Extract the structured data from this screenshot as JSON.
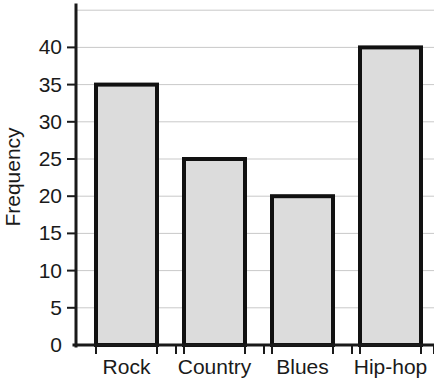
{
  "chart_data": {
    "type": "bar",
    "title": "",
    "xlabel": "",
    "ylabel": "Frequency",
    "categories": [
      "Rock",
      "Country",
      "Blues",
      "Hip-hop"
    ],
    "values": [
      35,
      25,
      20,
      40
    ],
    "ylim": [
      0,
      45
    ],
    "ytick_labels": [
      "0",
      "5",
      "10",
      "15",
      "20",
      "25",
      "30",
      "35",
      "40"
    ],
    "ytick_values": [
      0,
      5,
      10,
      15,
      20,
      25,
      30,
      35,
      40
    ],
    "ytick_step": 5,
    "grid": true,
    "grid_axis": "y",
    "legend": false,
    "legend_position": "none",
    "bar_fill_color": "#dcdcdc",
    "bar_border_color": "#111111",
    "gridline_color": "#c9c9c9",
    "axis_color": "#1a1a1a",
    "background_color": "#ffffff"
  }
}
